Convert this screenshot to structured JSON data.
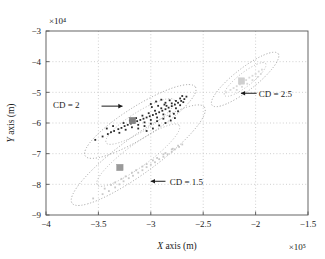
{
  "figure": {
    "background": "#ffffff",
    "frame_color": "#555555",
    "grid_color": "#bbbbbb"
  },
  "chart_data": {
    "type": "scatter",
    "title": "",
    "xlabel": "X axis (m)",
    "ylabel": "Y axis (m)",
    "x_exponent": "×10⁵",
    "y_exponent": "×10⁴",
    "xlim": [
      -4.0,
      -1.5
    ],
    "ylim": [
      -9.0,
      -3.0
    ],
    "xticks": [
      -4,
      -3.5,
      -3,
      -2.5,
      -2,
      -1.5
    ],
    "xtick_labels": [
      "−4",
      "−3.5",
      "−3",
      "−2.5",
      "−2",
      "−1.5"
    ],
    "yticks": [
      -9,
      -8,
      -7,
      -6,
      -5,
      -4,
      -3
    ],
    "ytick_labels": [
      "−9",
      "−8",
      "−7",
      "−6",
      "−5",
      "−4",
      "−3"
    ],
    "grid": true,
    "grid_style": "dotted",
    "legend": "none",
    "annotations": [
      {
        "text": "CD = 2",
        "arrow": "right",
        "text_x": -3.68,
        "text_y": -5.42,
        "arrow_from_x": -3.47,
        "arrow_from_y": -5.45,
        "arrow_to_x": -3.27,
        "arrow_to_y": -5.45
      },
      {
        "text": "CD = 2.5",
        "arrow": "left",
        "text_x": -1.97,
        "text_y": -5.05,
        "arrow_from_x": -1.99,
        "arrow_from_y": -5.03,
        "arrow_to_x": -2.14,
        "arrow_to_y": -5.03
      },
      {
        "text": "CD = 1.5",
        "arrow": "left",
        "text_x": -2.82,
        "text_y": -7.93,
        "arrow_from_x": -2.86,
        "arrow_from_y": -7.9,
        "arrow_to_x": -3.0,
        "arrow_to_y": -7.9
      }
    ],
    "series": [
      {
        "name": "CD = 1.5",
        "color": "#c8c8c8",
        "marker_color": "#9a9a9a",
        "centroid": [
          -3.295,
          -7.45
        ],
        "ellipse": {
          "center": [
            -3.12,
            -7.05
          ],
          "semi_major": 0.78,
          "semi_minor": 0.175,
          "angle_deg": -36.0,
          "units": "axis-fraction-major-in-x1e5"
        },
        "points": [
          [
            -3.55,
            -8.46
          ],
          [
            -3.46,
            -8.32
          ],
          [
            -3.4,
            -8.22
          ],
          [
            -3.34,
            -8.1
          ],
          [
            -3.3,
            -8.0
          ],
          [
            -3.26,
            -7.9
          ],
          [
            -3.21,
            -7.8
          ],
          [
            -3.17,
            -7.72
          ],
          [
            -3.12,
            -7.62
          ],
          [
            -3.08,
            -7.54
          ],
          [
            -3.04,
            -7.44
          ],
          [
            -3.0,
            -7.36
          ],
          [
            -2.96,
            -7.28
          ],
          [
            -2.92,
            -7.18
          ],
          [
            -2.88,
            -7.1
          ],
          [
            -2.84,
            -7.02
          ],
          [
            -2.8,
            -6.94
          ],
          [
            -2.77,
            -6.86
          ],
          [
            -2.73,
            -6.78
          ],
          [
            -2.7,
            -6.7
          ],
          [
            -3.38,
            -8.02
          ],
          [
            -3.28,
            -7.82
          ],
          [
            -3.18,
            -7.62
          ],
          [
            -3.08,
            -7.42
          ],
          [
            -2.98,
            -7.22
          ],
          [
            -2.88,
            -7.02
          ],
          [
            -2.8,
            -6.86
          ],
          [
            -2.74,
            -6.74
          ],
          [
            -3.44,
            -8.14
          ],
          [
            -3.34,
            -7.94
          ],
          [
            -3.24,
            -7.74
          ],
          [
            -3.14,
            -7.54
          ],
          [
            -3.04,
            -7.34
          ],
          [
            -2.94,
            -7.14
          ],
          [
            -2.86,
            -6.98
          ],
          [
            -2.79,
            -6.84
          ]
        ]
      },
      {
        "name": "CD = 2",
        "color": "#2b2b2b",
        "marker_color": "#808080",
        "centroid": [
          -3.175,
          -5.92
        ],
        "ellipse": {
          "center": [
            -3.1,
            -5.95
          ],
          "semi_major": 0.62,
          "semi_minor": 0.15,
          "angle_deg": -32.0,
          "units": "axis-fraction-major-in-x1e5"
        },
        "points": [
          [
            -3.53,
            -6.55
          ],
          [
            -3.46,
            -6.44
          ],
          [
            -3.41,
            -6.36
          ],
          [
            -3.38,
            -6.3
          ],
          [
            -3.35,
            -6.26
          ],
          [
            -3.31,
            -6.2
          ],
          [
            -3.28,
            -6.16
          ],
          [
            -3.25,
            -6.1
          ],
          [
            -3.22,
            -6.06
          ],
          [
            -3.19,
            -6.02
          ],
          [
            -3.16,
            -5.98
          ],
          [
            -3.13,
            -5.94
          ],
          [
            -3.1,
            -5.9
          ],
          [
            -3.07,
            -5.86
          ],
          [
            -3.04,
            -5.82
          ],
          [
            -3.01,
            -5.78
          ],
          [
            -2.98,
            -5.74
          ],
          [
            -2.95,
            -5.7
          ],
          [
            -2.92,
            -5.65
          ],
          [
            -2.89,
            -5.6
          ],
          [
            -2.86,
            -5.55
          ],
          [
            -2.83,
            -5.5
          ],
          [
            -2.8,
            -5.45
          ],
          [
            -2.77,
            -5.4
          ],
          [
            -2.74,
            -5.34
          ],
          [
            -2.71,
            -5.28
          ],
          [
            -2.68,
            -5.22
          ],
          [
            -2.66,
            -5.14
          ],
          [
            -3.3,
            -6.32
          ],
          [
            -3.24,
            -6.22
          ],
          [
            -3.18,
            -6.14
          ],
          [
            -3.12,
            -6.06
          ],
          [
            -3.06,
            -5.98
          ],
          [
            -3.0,
            -5.9
          ],
          [
            -2.94,
            -5.82
          ],
          [
            -2.88,
            -5.72
          ],
          [
            -2.82,
            -5.62
          ],
          [
            -2.76,
            -5.52
          ],
          [
            -2.72,
            -5.42
          ],
          [
            -2.69,
            -5.32
          ],
          [
            -3.26,
            -6.0
          ],
          [
            -3.2,
            -5.92
          ],
          [
            -3.14,
            -5.84
          ],
          [
            -3.08,
            -5.76
          ],
          [
            -3.02,
            -5.68
          ],
          [
            -2.96,
            -5.6
          ],
          [
            -2.9,
            -5.52
          ],
          [
            -2.85,
            -5.44
          ],
          [
            -2.8,
            -5.36
          ],
          [
            -2.76,
            -5.28
          ],
          [
            -2.72,
            -5.2
          ],
          [
            -2.7,
            -5.12
          ],
          [
            -3.12,
            -6.18
          ],
          [
            -3.06,
            -6.1
          ],
          [
            -3.0,
            -6.02
          ],
          [
            -2.94,
            -5.94
          ],
          [
            -2.88,
            -5.86
          ],
          [
            -2.82,
            -5.78
          ],
          [
            -2.78,
            -5.7
          ],
          [
            -2.74,
            -5.62
          ],
          [
            -3.04,
            -6.26
          ],
          [
            -2.98,
            -6.18
          ],
          [
            -2.92,
            -6.08
          ],
          [
            -2.86,
            -6.0
          ],
          [
            -2.81,
            -5.92
          ],
          [
            -2.77,
            -5.84
          ],
          [
            -2.86,
            -5.34
          ],
          [
            -2.82,
            -5.26
          ],
          [
            -2.9,
            -5.24
          ],
          [
            -2.95,
            -5.3
          ],
          [
            -3.0,
            -5.38
          ],
          [
            -2.99,
            -5.48
          ],
          [
            -2.93,
            -5.44
          ],
          [
            -2.87,
            -5.4
          ],
          [
            -3.36,
            -6.1
          ],
          [
            -3.42,
            -6.18
          ]
        ]
      },
      {
        "name": "CD = 2.5",
        "color": "#d8d8d8",
        "marker_color": "#cfcfcf",
        "centroid": [
          -2.135,
          -4.63
        ],
        "ellipse": {
          "center": [
            -2.1,
            -4.58
          ],
          "semi_major": 0.4,
          "semi_minor": 0.105,
          "angle_deg": -38.0,
          "units": "axis-fraction-major-in-x1e5"
        },
        "points": [
          [
            -2.28,
            -5.0
          ],
          [
            -2.24,
            -4.92
          ],
          [
            -2.21,
            -4.86
          ],
          [
            -2.18,
            -4.8
          ],
          [
            -2.15,
            -4.74
          ],
          [
            -2.12,
            -4.66
          ],
          [
            -2.09,
            -4.6
          ],
          [
            -2.06,
            -4.52
          ],
          [
            -2.03,
            -4.46
          ],
          [
            -2.0,
            -4.4
          ],
          [
            -1.97,
            -4.32
          ],
          [
            -1.94,
            -4.26
          ],
          [
            -2.18,
            -4.92
          ],
          [
            -2.13,
            -4.82
          ],
          [
            -2.08,
            -4.72
          ],
          [
            -2.03,
            -4.6
          ],
          [
            -1.98,
            -4.5
          ],
          [
            -1.95,
            -4.4
          ]
        ]
      }
    ]
  }
}
